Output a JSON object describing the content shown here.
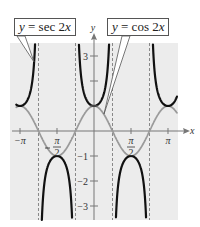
{
  "chart_data": {
    "type": "line",
    "title": "",
    "xlabel": "x",
    "ylabel": "y",
    "xlim": [
      -3.3,
      3.55
    ],
    "ylim": [
      -3.56,
      3.52
    ],
    "grid": false,
    "shaded_background": "#ececec",
    "x_ticks": [
      {
        "value": -3.14159,
        "label": "−π"
      },
      {
        "value": -1.5708,
        "label": "−π/2",
        "num": "π",
        "den": "2",
        "neg": true
      },
      {
        "value": 1.5708,
        "label": "π/2",
        "num": "π",
        "den": "2",
        "neg": false
      },
      {
        "value": 3.14159,
        "label": "π"
      }
    ],
    "y_ticks": [
      {
        "value": 3,
        "label": "3"
      },
      {
        "value": 2,
        "label": ""
      },
      {
        "value": 1,
        "label": ""
      },
      {
        "value": -1,
        "label": "−1"
      },
      {
        "value": -2,
        "label": "−2"
      },
      {
        "value": -3,
        "label": "−3"
      }
    ],
    "asymptotes": [
      -2.3562,
      -0.7854,
      0.7854,
      2.3562
    ],
    "series": [
      {
        "name": "y = sec 2x",
        "function": "sec(2x)",
        "color": "#111111",
        "width": 2.2
      },
      {
        "name": "y = cos 2x",
        "function": "cos(2x)",
        "color": "#9a9a9a",
        "width": 1.8
      }
    ],
    "annotations": [
      {
        "text_pre": "y",
        "text_mid": " = sec 2",
        "text_var": "x",
        "series": "y = sec 2x"
      },
      {
        "text_pre": "y",
        "text_mid": " = cos 2",
        "text_var": "x",
        "series": "y = cos 2x"
      }
    ]
  }
}
